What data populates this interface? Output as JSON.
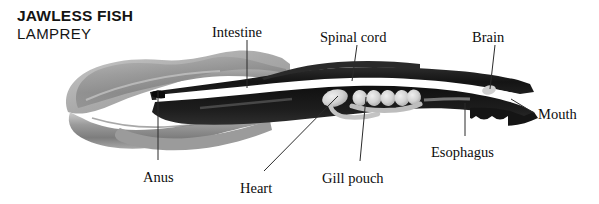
{
  "figure": {
    "title_main": "JAWLESS FISH",
    "title_sub": "LAMPREY",
    "background_color": "#ffffff"
  },
  "palette": {
    "ink": "#0d0d0d",
    "body_dark": "#1a1a1a",
    "body_mid": "#4a4a4a",
    "fin_gray": "#8e8e8e",
    "fin_gray_light": "#b3b3b3",
    "organ_light": "#d8d8d8",
    "cord_white": "#ffffff",
    "leader_line": "#2b2b2b"
  },
  "labels": [
    {
      "id": "intestine",
      "text": "Intestine",
      "x": 212,
      "y": 24,
      "anchor": "start"
    },
    {
      "id": "spinal_cord",
      "text": "Spinal cord",
      "x": 320,
      "y": 29,
      "anchor": "start"
    },
    {
      "id": "brain",
      "text": "Brain",
      "x": 472,
      "y": 29,
      "anchor": "start"
    },
    {
      "id": "mouth",
      "text": "Mouth",
      "x": 538,
      "y": 106,
      "anchor": "start"
    },
    {
      "id": "esophagus",
      "text": "Esophagus",
      "x": 431,
      "y": 144,
      "anchor": "start"
    },
    {
      "id": "gill_pouch",
      "text": "Gill pouch",
      "x": 322,
      "y": 170,
      "anchor": "start"
    },
    {
      "id": "heart",
      "text": "Heart",
      "x": 240,
      "y": 180,
      "anchor": "start"
    },
    {
      "id": "anus",
      "text": "Anus",
      "x": 143,
      "y": 169,
      "anchor": "start"
    }
  ],
  "leader_lines": [
    {
      "id": "intestine-leader",
      "x1": 247,
      "y1": 40,
      "x2": 247,
      "y2": 88
    },
    {
      "id": "spinal-cord-leader",
      "x1": 357,
      "y1": 45,
      "x2": 352,
      "y2": 81
    },
    {
      "id": "brain-leader",
      "x1": 495,
      "y1": 45,
      "x2": 490,
      "y2": 89
    },
    {
      "id": "mouth-leader",
      "x1": 511,
      "y1": 99,
      "x2": 534,
      "y2": 113
    },
    {
      "id": "esophagus-leader",
      "x1": 465,
      "y1": 103,
      "x2": 465,
      "y2": 136
    },
    {
      "id": "gill-pouch-leader",
      "x1": 366,
      "y1": 97,
      "x2": 360,
      "y2": 161
    },
    {
      "id": "heart-leader",
      "x1": 338,
      "y1": 96,
      "x2": 264,
      "y2": 171
    },
    {
      "id": "anus-leader",
      "x1": 158,
      "y1": 90,
      "x2": 158,
      "y2": 160
    }
  ],
  "anatomy_parts": [
    {
      "id": "tail-fin",
      "name": "Tail and caudal fin region"
    },
    {
      "id": "body-trunk",
      "name": "Dark muscular body trunk"
    },
    {
      "id": "spinal-cord",
      "name": "Spinal cord (white longitudinal stripe)"
    },
    {
      "id": "notochord",
      "name": "Notochord band"
    },
    {
      "id": "heart",
      "name": "Heart (single pale oval)"
    },
    {
      "id": "gill-pouches",
      "name": "Gill pouches (series of pale ovals)"
    },
    {
      "id": "esophagus",
      "name": "Esophagus channel"
    },
    {
      "id": "brain",
      "name": "Brain (pale spot at head)"
    },
    {
      "id": "mouth",
      "name": "Oral disc / mouth"
    },
    {
      "id": "intestine",
      "name": "Intestine"
    },
    {
      "id": "anus",
      "name": "Anus"
    }
  ]
}
